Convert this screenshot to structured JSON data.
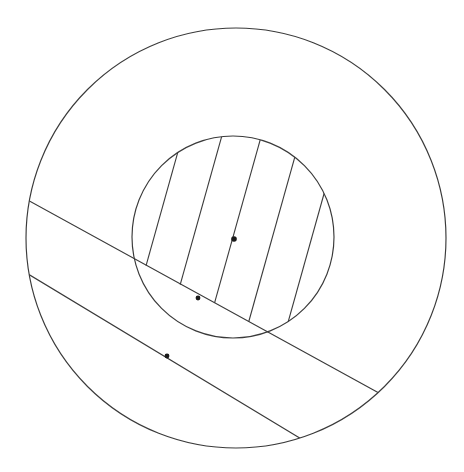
{
  "figure": {
    "canvas": {
      "width": 464,
      "height": 472,
      "background": "#ffffff"
    },
    "stroke_color": "#3a3a3a",
    "dot_color": "#1a1a1a"
  },
  "shapes": {
    "outer_circle": {
      "name": "outer-circle",
      "cx": 236,
      "cy": 238,
      "r": 210,
      "stroke": "#3a3a3a",
      "stroke_width": 1.15,
      "fill": "none"
    },
    "inner_circle": {
      "name": "inner-circle",
      "cx": 233,
      "cy": 237,
      "r": 101,
      "stroke": "#3a3a3a",
      "stroke_width": 1.15,
      "fill": "none",
      "hatched": true
    },
    "band": {
      "name": "secant-band",
      "slope": 0.549,
      "angle_degrees": 28.8,
      "upper_line": {
        "x1": 33,
        "y1": 203,
        "x2": 388,
        "y2": 398
      },
      "lower_line": {
        "x1": 33,
        "y1": 277,
        "x2": 303,
        "y2": 440
      },
      "width_vertical": 74
    }
  },
  "hatching": {
    "name": "diagonal-hatch",
    "angle_degrees": 74,
    "spacing": 38,
    "stroke": "#3a3a3a",
    "stroke_width": 1.1,
    "dx_per_dy": -0.28,
    "count": 9
  },
  "markers": [
    {
      "name": "center-dot",
      "cx": 234,
      "cy": 239,
      "r": 2.8,
      "label": ""
    },
    {
      "name": "band-inner-dot",
      "cx": 198,
      "cy": 298,
      "r": 2.4,
      "label": ""
    },
    {
      "name": "band-lower-dot",
      "cx": 167,
      "cy": 356,
      "r": 2.4,
      "label": ""
    }
  ],
  "chart_data": {
    "type": "diagram",
    "elements": [
      {
        "kind": "circle",
        "role": "outer boundary",
        "cx": 236,
        "cy": 238,
        "r": 210
      },
      {
        "kind": "circle",
        "role": "inner disc (hatched)",
        "cx": 233,
        "cy": 237,
        "r": 101
      },
      {
        "kind": "line",
        "role": "band upper edge",
        "from": [
          33,
          203
        ],
        "to": [
          388,
          398
        ]
      },
      {
        "kind": "line",
        "role": "band lower edge",
        "from": [
          33,
          277
        ],
        "to": [
          303,
          440
        ]
      },
      {
        "kind": "point",
        "role": "inner disc center",
        "at": [
          234,
          239
        ]
      },
      {
        "kind": "point",
        "role": "point in band within disc",
        "at": [
          198,
          298
        ]
      },
      {
        "kind": "point",
        "role": "point on band lower edge",
        "at": [
          167,
          356
        ]
      }
    ]
  }
}
